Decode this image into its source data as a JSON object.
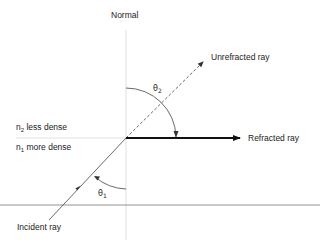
{
  "diagram": {
    "labels": {
      "normal": "Normal",
      "unrefracted_ray": "Unrefracted ray",
      "refracted_ray": "Refracted ray",
      "incident_ray": "Incident ray",
      "medium_top": {
        "symbol": "n",
        "subscript": "2",
        "text": " less dense"
      },
      "medium_bottom": {
        "symbol": "n",
        "subscript": "1",
        "text": " more dense"
      },
      "angle_1": {
        "symbol": "θ",
        "subscript": "1"
      },
      "angle_2": {
        "symbol": "θ",
        "subscript": "2"
      }
    },
    "colors": {
      "line": "#444444",
      "thin_guides": "#d8d8d8",
      "refracted": "#111111",
      "text": "#222222"
    }
  }
}
